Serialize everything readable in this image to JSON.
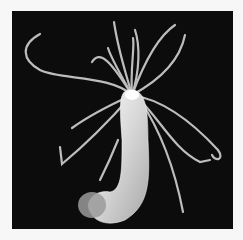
{
  "image": {
    "subject": "hydra polyp with tentacles on black background",
    "background_color": "#0c0c0c",
    "border_color": "#f7f7f7",
    "organism_color": "#e8e8e8"
  }
}
